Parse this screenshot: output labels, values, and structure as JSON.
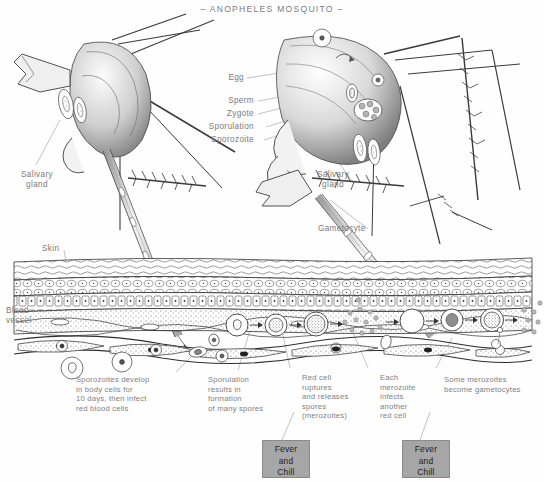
{
  "title": "– ANOPHELES MOSQUITO –",
  "labels": {
    "egg": "Egg",
    "sperm": "Sperm",
    "zygote": "Zygote",
    "sporulation": "Sporulation",
    "sporozoite": "Sporozoite",
    "salivary_gland_left": "Salivary\ngland",
    "salivary_gland_right": "Salivary\ngland",
    "gametocyte": "Gametocyte",
    "skin": "Skin",
    "blood_vessel": "Blood\nvessel"
  },
  "captions": {
    "sporozoites_develop": "Sporozoites develop\nin body cells for\n10 days, then infect\nred blood cells",
    "sporulation_results": "Sporulation\nresults in\nformation\nof many spores",
    "red_cell_ruptures": "Red cell\nruptures\nand releases\nspores\n(merozoites)",
    "each_merozoite": "Each\nmerozoite\ninfects\nanother\nred cell",
    "some_merozoites": "Some merozoites\nbecome gametocytes"
  },
  "fever_boxes": [
    {
      "text": "Fever\nand\nChill"
    },
    {
      "text": "Fever\nand\nChill"
    }
  ],
  "colors": {
    "ink": "#2b2b2b",
    "label_text": "#7a7a7a",
    "fever_box_fill": "#a6a6a6",
    "fever_box_text": "#1d1d1d",
    "page_background": "#ffffff",
    "leader_line": "#9a9a9a"
  },
  "lifecycle_stages": [
    {
      "name": "infected-red-cell",
      "stage": 1
    },
    {
      "name": "trophozoite-growing",
      "stage": 2
    },
    {
      "name": "schizont-dividing",
      "stage": 3
    },
    {
      "name": "merozoites-released",
      "stage": 4
    },
    {
      "name": "free-red-cell",
      "stage": 5
    },
    {
      "name": "newly-infected-cell",
      "stage": 6
    },
    {
      "name": "schizont-second-round",
      "stage": 7
    },
    {
      "name": "merozoites-released-again",
      "stage": 8
    }
  ]
}
